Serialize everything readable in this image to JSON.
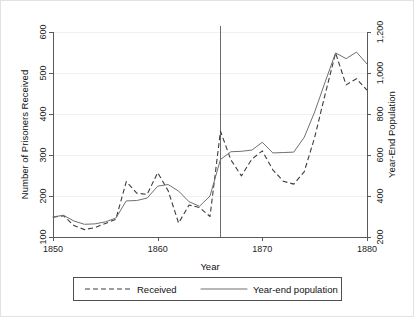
{
  "chart_data": {
    "type": "line",
    "title": "",
    "xlabel": "Year",
    "ylabel": "Number of Prisoners Received",
    "y2label": "Year-End Population",
    "xlim": [
      1850,
      1880
    ],
    "ylim": [
      100,
      600
    ],
    "y2lim": [
      200,
      1200
    ],
    "grid": true,
    "legend_position": "bottom",
    "x_ticks": [
      "1850",
      "1860",
      "1870",
      "1880"
    ],
    "x_tick_values": [
      1850,
      1860,
      1870,
      1880
    ],
    "y_ticks": [
      "100",
      "200",
      "300",
      "400",
      "500",
      "600"
    ],
    "y_tick_values": [
      100,
      200,
      300,
      400,
      500,
      600
    ],
    "y2_ticks": [
      "200",
      "400",
      "600",
      "800",
      "1,000",
      "1,200"
    ],
    "y2_tick_values": [
      200,
      400,
      600,
      800,
      1000,
      1200
    ],
    "annotations": [
      {
        "name": "vertical-reference-line",
        "type": "vline",
        "x": 1866
      }
    ],
    "x": [
      1850,
      1851,
      1852,
      1853,
      1854,
      1855,
      1856,
      1857,
      1858,
      1859,
      1860,
      1861,
      1862,
      1863,
      1864,
      1865,
      1866,
      1867,
      1868,
      1869,
      1870,
      1871,
      1872,
      1873,
      1874,
      1875,
      1876,
      1877,
      1878,
      1879,
      1880
    ],
    "series": [
      {
        "name": "Received",
        "style": "dashed",
        "axis": "left",
        "color": "#3c3c3c",
        "values": [
          148,
          152,
          128,
          118,
          123,
          133,
          143,
          235,
          207,
          204,
          257,
          213,
          134,
          178,
          172,
          150,
          358,
          288,
          249,
          290,
          310,
          264,
          236,
          229,
          259,
          343,
          448,
          549,
          471,
          486,
          458
        ]
      },
      {
        "name": "Year-end population",
        "style": "solid",
        "axis": "right",
        "color": "#707070",
        "values_left_scale": [
          149,
          153,
          139,
          131,
          132,
          137,
          146,
          188,
          189,
          195,
          224,
          228,
          212,
          186,
          175,
          200,
          289,
          308,
          309,
          312,
          331,
          305,
          306,
          307,
          343,
          405,
          478,
          549,
          535,
          551,
          522
        ],
        "values": [
          298,
          306,
          278,
          262,
          264,
          274,
          292,
          376,
          378,
          390,
          448,
          456,
          424,
          372,
          350,
          400,
          578,
          616,
          618,
          624,
          662,
          610,
          612,
          614,
          686,
          810,
          956,
          1098,
          1070,
          1102,
          1044
        ]
      }
    ]
  },
  "axes": {
    "x_title": "Year",
    "y_left_title": "Number of Prisoners Received",
    "y_right_title": "Year-End Population"
  },
  "legend": {
    "items": [
      {
        "label": "Received",
        "style": "dashed"
      },
      {
        "label": "Year-end population",
        "style": "solid"
      }
    ]
  }
}
